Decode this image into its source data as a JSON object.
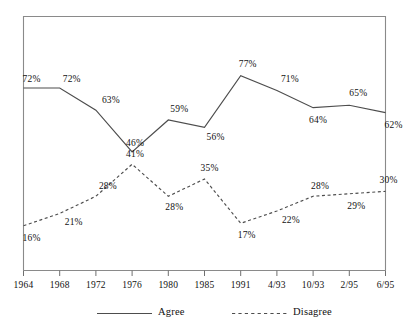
{
  "chart_data": {
    "type": "line",
    "title": "",
    "subtitle": "",
    "xlabel": "",
    "ylabel": "",
    "grid": false,
    "legend_position": "bottom",
    "ylim": [
      0,
      100
    ],
    "value_suffix": "%",
    "categories": [
      "1964",
      "1968",
      "1972",
      "1976",
      "1980",
      "1985",
      "1991",
      "4/93",
      "10/93",
      "2/95",
      "6/95"
    ],
    "series": [
      {
        "name": "Agree",
        "style": "solid",
        "color": "#4d4d4d",
        "values": [
          72,
          72,
          63,
          46,
          59,
          56,
          77,
          71,
          64,
          65,
          62
        ],
        "labels": [
          "72%",
          "72%",
          "63%",
          "46%",
          "59%",
          "56%",
          "77%",
          "71%",
          "64%",
          "65%",
          "62%"
        ]
      },
      {
        "name": "Disagree",
        "style": "dashed",
        "color": "#4d4d4d",
        "values": [
          16,
          21,
          28,
          41,
          28,
          35,
          17,
          22,
          28,
          29,
          30
        ],
        "labels": [
          "16%",
          "21%",
          "28%",
          "41%",
          "28%",
          "35%",
          "17%",
          "22%",
          "28%",
          "29%",
          "30%"
        ]
      }
    ]
  },
  "legend": {
    "items": [
      {
        "label": "Agree",
        "style": "solid"
      },
      {
        "label": "Disagree",
        "style": "dashed"
      }
    ]
  },
  "frame": {
    "border_color": "#8a8a8a"
  }
}
